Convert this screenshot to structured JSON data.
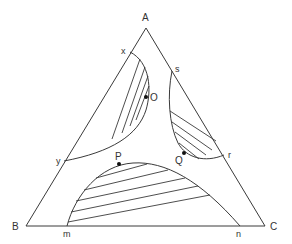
{
  "diagram": {
    "type": "ternary-phase-diagram",
    "vertices": {
      "top": "A",
      "bottom_left": "B",
      "bottom_right": "C"
    },
    "regions": [
      {
        "name": "A-B-side two-phase region",
        "boundary_endpoints": [
          "x",
          "y"
        ],
        "point_on_boundary": "O",
        "hatched": true
      },
      {
        "name": "A-C-side two-phase region",
        "boundary_endpoints": [
          "s",
          "r"
        ],
        "point_on_boundary": "Q",
        "hatched": true
      },
      {
        "name": "B-C-side two-phase region",
        "boundary_endpoints": [
          "m",
          "n"
        ],
        "point_on_boundary": "P",
        "hatched": true
      }
    ],
    "labels": {
      "A": "A",
      "B": "B",
      "C": "C",
      "x": "x",
      "y": "y",
      "s": "s",
      "r": "r",
      "m": "m",
      "n": "n",
      "O": "O",
      "P": "P",
      "Q": "Q"
    }
  }
}
